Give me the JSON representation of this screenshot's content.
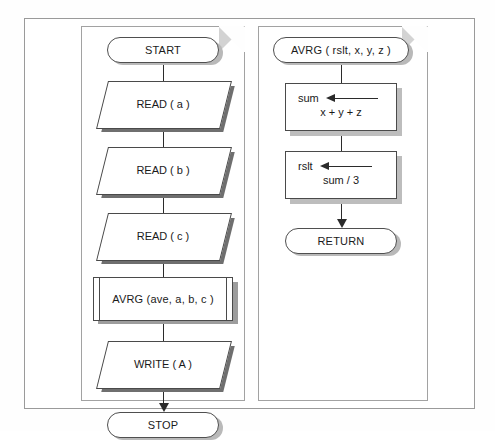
{
  "figure": {
    "colors": {
      "line": "#2b2b2b",
      "shape_border": "#4a4a4a",
      "panel_border": "#a2a2a2",
      "frame_border": "#9a9a9a",
      "shadow": "#8f8f8f",
      "fold": "#d3d3d3",
      "background": "#ffffff"
    }
  },
  "main_flowchart": {
    "name": "main-program-page",
    "nodes": [
      {
        "id": "start",
        "type": "terminator",
        "label": "START"
      },
      {
        "id": "read_a",
        "type": "input-output",
        "label": "READ ( a )"
      },
      {
        "id": "read_b",
        "type": "input-output",
        "label": "READ ( b )"
      },
      {
        "id": "read_c",
        "type": "input-output",
        "label": "READ ( c )"
      },
      {
        "id": "avrg",
        "type": "predefined-process",
        "label": "AVRG (ave, a, b, c )"
      },
      {
        "id": "write",
        "type": "input-output",
        "label": "WRITE ( A )"
      },
      {
        "id": "stop",
        "type": "terminator",
        "label": "STOP"
      }
    ]
  },
  "subroutine_flowchart": {
    "name": "avrg-subroutine-page",
    "nodes": [
      {
        "id": "avrg_header",
        "type": "terminator",
        "label": "AVRG ( rslt, x, y, z )"
      },
      {
        "id": "sum_assign",
        "type": "process-assignment",
        "target": "sum",
        "arrow": "assignment-arrow-left",
        "expression": "x + y + z"
      },
      {
        "id": "rslt_assign",
        "type": "process-assignment",
        "target": "rslt",
        "arrow": "assignment-arrow-left",
        "expression": "sum / 3"
      },
      {
        "id": "return",
        "type": "terminator",
        "label": "RETURN"
      }
    ]
  }
}
